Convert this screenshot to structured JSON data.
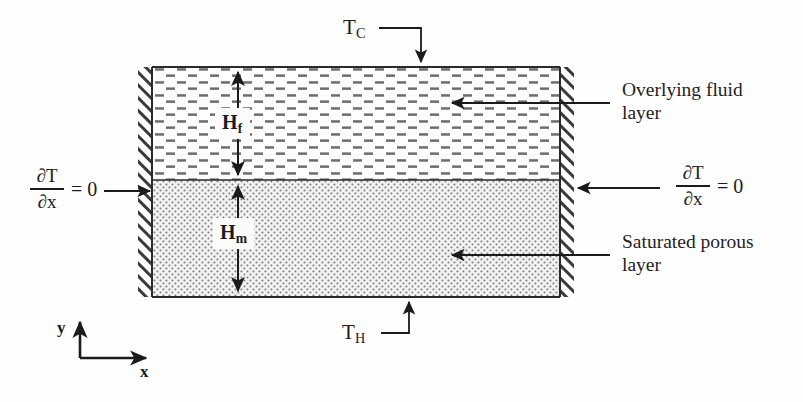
{
  "figure": {
    "type": "schematic-diagram",
    "geometry": {
      "box_left_px": 152,
      "box_right_px": 560,
      "box_top_px": 67,
      "box_bottom_px": 297,
      "interface_y_px": 180,
      "wall_thickness_px": 14
    },
    "top_boundary": {
      "label_text": "T",
      "label_sub": "C",
      "meaning": "cold-temperature boundary at top wall",
      "leader": "elbow-right-then-down"
    },
    "bottom_boundary": {
      "label_text": "T",
      "label_sub": "H",
      "meaning": "hot-temperature boundary at bottom wall",
      "leader": "elbow-right-then-up"
    },
    "left_boundary": {
      "numerator": "∂T",
      "denominator": "∂x",
      "equals": "= 0",
      "meaning": "adiabatic / insulated left side wall",
      "leader": "horizontal-arrow-right"
    },
    "right_boundary": {
      "numerator": "∂T",
      "denominator": "∂x",
      "equals": "= 0",
      "meaning": "adiabatic / insulated right side wall",
      "leader": "horizontal-arrow-left"
    },
    "layers": [
      {
        "id": "fluid",
        "annotation_line1": "Overlying fluid",
        "annotation_line2": "layer",
        "height_symbol": "H",
        "height_subscript": "f",
        "fill_pattern": "horizontal-dashes",
        "fill_color": "#fdfdfd",
        "pattern_color": "#6d6d6d"
      },
      {
        "id": "porous",
        "annotation_line1": "Saturated porous",
        "annotation_line2": "layer",
        "height_symbol": "H",
        "height_subscript": "m",
        "fill_pattern": "fine-stipple-dots",
        "fill_color": "#f2f2f2",
        "pattern_color": "#767676"
      }
    ],
    "axes": {
      "x_label": "x",
      "y_label": "y",
      "origin_px": [
        80,
        358
      ]
    },
    "colors": {
      "ink": "#1b1b1b",
      "line": "#2a2a2a",
      "hatch": "#3a3a3a",
      "background": "#fefefe"
    }
  }
}
